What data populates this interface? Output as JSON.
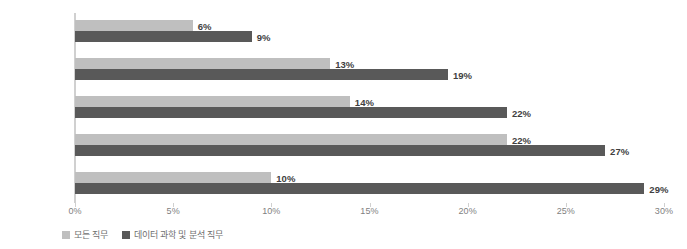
{
  "chart_data": {
    "type": "bar",
    "orientation": "horizontal",
    "title": "",
    "subtitle": "",
    "xlabel": "",
    "ylabel": "",
    "xlim": [
      0,
      30
    ],
    "xtick_labels": [
      "0%",
      "5%",
      "10%",
      "15%",
      "20%",
      "25%",
      "30%"
    ],
    "xticks": [
      0,
      5,
      10,
      15,
      20,
      25,
      30
    ],
    "grid": false,
    "legend_position": "bottom-left",
    "categories": [
      "창의력",
      "팀워크",
      "문제 해결 능력",
      "글쓰기",
      "자료 조사"
    ],
    "series": [
      {
        "name": "모든 직무",
        "color": "#bfbfbf",
        "values": [
          6,
          13,
          14,
          22,
          10
        ],
        "labels": [
          "6%",
          "13%",
          "14%",
          "22%",
          "10%"
        ]
      },
      {
        "name": "데이터 과학 및 분석 직무",
        "color": "#595959",
        "values": [
          9,
          19,
          22,
          27,
          29
        ],
        "labels": [
          "9%",
          "19%",
          "22%",
          "27%",
          "29%"
        ]
      }
    ]
  },
  "axis": {
    "line_color": "#d0d0d0",
    "tick_label_color": "#7f7f7f"
  },
  "legend": {
    "items": [
      {
        "label": "모든 직무",
        "color": "#bfbfbf"
      },
      {
        "label": "데이터 과학 및 분석 직무",
        "color": "#595959"
      }
    ]
  }
}
